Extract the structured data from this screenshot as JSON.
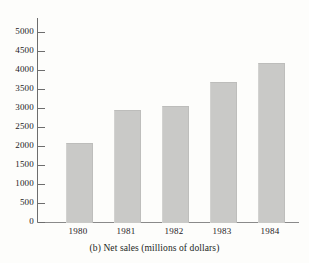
{
  "chart_data": {
    "type": "bar",
    "title": "",
    "caption": "(b) Net sales (millions of dollars)",
    "xlabel": "",
    "ylabel": "",
    "categories": [
      "1980",
      "1981",
      "1982",
      "1983",
      "1984"
    ],
    "values": [
      2090,
      2950,
      3060,
      3680,
      4190
    ],
    "series": [
      {
        "name": "Net sales",
        "values": [
          2090,
          2950,
          3060,
          3680,
          4190
        ]
      }
    ],
    "ylim": [
      0,
      5000
    ],
    "ytick_step": 500,
    "ytick_labels": [
      "0",
      "500",
      "1000",
      "1500",
      "2000",
      "2500",
      "3000",
      "3500",
      "4000",
      "4500",
      "5000"
    ],
    "ytick_values": [
      0,
      500,
      1000,
      1500,
      2000,
      2500,
      3000,
      3500,
      4000,
      4500,
      5000
    ],
    "grid": false,
    "legend": false,
    "legend_position": "none",
    "bar_color": "#c9c9c7",
    "axis_color": "#6d6d6d",
    "text_color": "#24211e",
    "background_color": "#fdfdfb"
  }
}
